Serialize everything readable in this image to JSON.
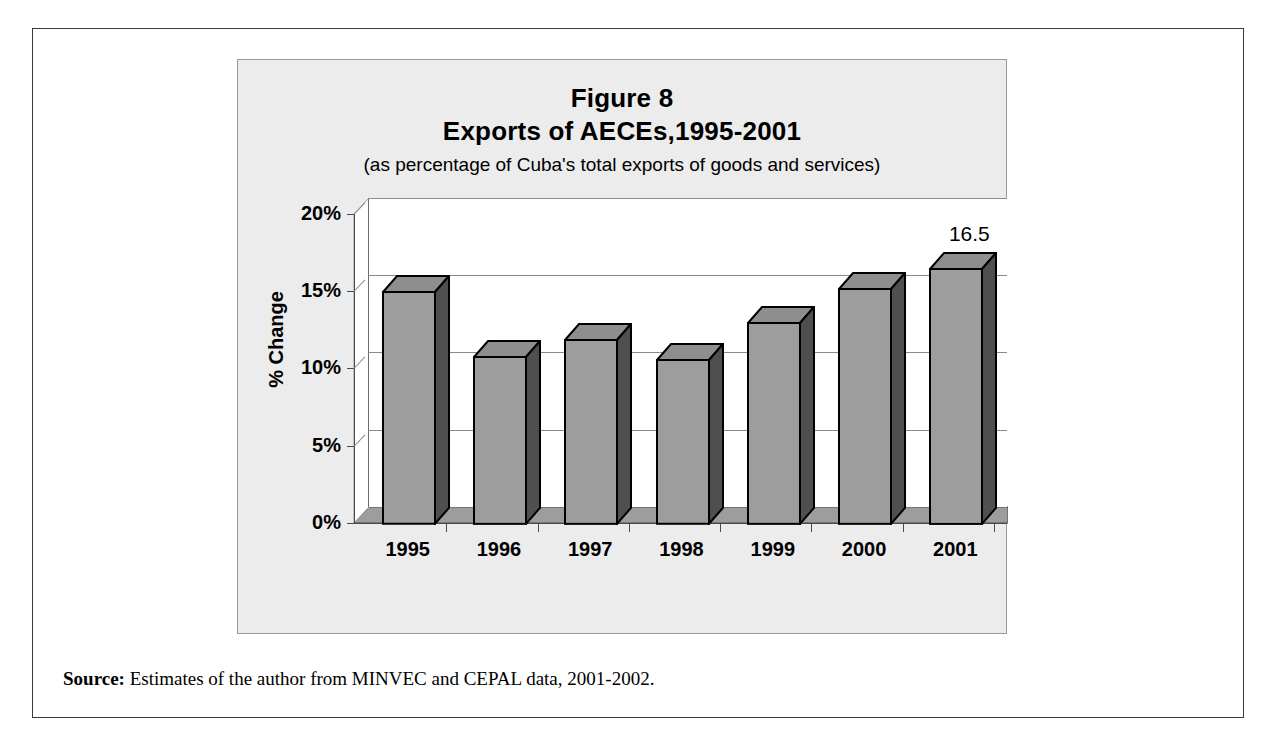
{
  "figure": {
    "title_line1": "Figure 8",
    "title_line2": "Exports of AECEs,1995-2001",
    "subtitle": "(as percentage of Cuba's total exports of goods and services)",
    "source_label": "Source:",
    "source_text": " Estimates of the author from MINVEC and CEPAL data, 2001-2002."
  },
  "chart_data": {
    "type": "bar",
    "subtitle": "(as percentage of Cuba's total exports of goods and services)",
    "xlabel": "",
    "ylabel": "% Change",
    "ylim": [
      0,
      20
    ],
    "ytick_values": [
      0,
      5,
      10,
      15,
      20
    ],
    "ytick_labels": [
      "0%",
      "5%",
      "10%",
      "15%",
      "20%"
    ],
    "grid": true,
    "legend": false,
    "three_d": true,
    "categories": [
      "1995",
      "1996",
      "1997",
      "1998",
      "1999",
      "2000",
      "2001"
    ],
    "values": [
      15.0,
      10.8,
      11.9,
      10.6,
      13.0,
      15.2,
      16.5
    ],
    "data_labels": [
      "",
      "",
      "",
      "",
      "",
      "",
      "16.5"
    ],
    "bar_fill": "#9d9d9d",
    "bar_edge": "#000000",
    "plot_bg": "#ffffff",
    "panel_bg": "#ececec",
    "floor_color": "#9d9d9d"
  }
}
